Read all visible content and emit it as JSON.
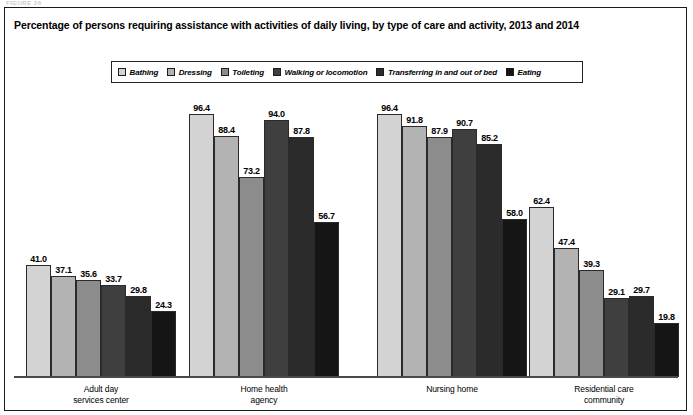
{
  "figure_label": "FIGURE 26",
  "title": "Percentage of persons requiring assistance with activities of daily living, by type of care and activity, 2013 and 2014",
  "legend": {
    "items": [
      {
        "label": "Bathing",
        "color": "#d3d3d3"
      },
      {
        "label": "Dressing",
        "color": "#b3b3b3"
      },
      {
        "label": "Toileting",
        "color": "#8c8c8c"
      },
      {
        "label": "Walking or locomotion",
        "color": "#3f3f3f"
      },
      {
        "label": "Transferring in and out of bed",
        "color": "#2b2b2b"
      },
      {
        "label": "Eating",
        "color": "#151515"
      }
    ]
  },
  "chart_data": {
    "type": "bar",
    "title": "Percentage of persons requiring assistance with activities of daily living, by type of care and activity, 2013 and 2014",
    "xlabel": "",
    "ylabel": "",
    "ylim": [
      0,
      100
    ],
    "grid": false,
    "legend_position": "top",
    "categories": [
      "Adult day services center",
      "Home health agency",
      "Nursing home",
      "Residential care community"
    ],
    "category_lines": [
      [
        "Adult day",
        "services center"
      ],
      [
        "Home health",
        "agency"
      ],
      [
        "Nursing home",
        ""
      ],
      [
        "Residential care",
        "community"
      ]
    ],
    "series": [
      {
        "name": "Bathing",
        "color": "#d3d3d3",
        "values": [
          41.0,
          96.4,
          96.4,
          62.4
        ]
      },
      {
        "name": "Dressing",
        "color": "#b3b3b3",
        "values": [
          37.1,
          88.4,
          91.8,
          47.4
        ]
      },
      {
        "name": "Toileting",
        "color": "#8c8c8c",
        "values": [
          35.6,
          73.2,
          87.9,
          39.3
        ]
      },
      {
        "name": "Walking or locomotion",
        "color": "#3f3f3f",
        "values": [
          33.7,
          94.0,
          90.7,
          29.1
        ]
      },
      {
        "name": "Transferring in and out of bed",
        "color": "#2b2b2b",
        "values": [
          29.8,
          87.8,
          85.2,
          29.7
        ]
      },
      {
        "name": "Eating",
        "color": "#151515",
        "values": [
          24.3,
          56.7,
          58.0,
          19.8
        ]
      }
    ],
    "value_labels": [
      [
        "41.0",
        "37.1",
        "35.6",
        "33.7",
        "29.8",
        "24.3"
      ],
      [
        "96.4",
        "88.4",
        "73.2",
        "94.0",
        "87.8",
        "56.7"
      ],
      [
        "96.4",
        "91.8",
        "87.9",
        "90.7",
        "85.2",
        "58.0"
      ],
      [
        "62.4",
        "47.4",
        "39.3",
        "29.1",
        "29.7",
        "19.8"
      ]
    ]
  },
  "layout": {
    "group_left_px": [
      26,
      189,
      377,
      529
    ],
    "bar_width_px": 25,
    "plot_height_px": 285,
    "px_per_unit": 2.73,
    "baseline_y_px": 376
  }
}
